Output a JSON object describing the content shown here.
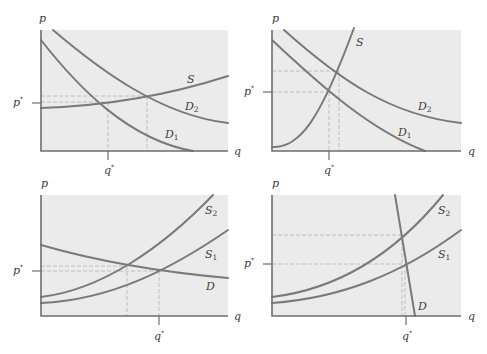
{
  "figure": {
    "panels": [
      {
        "id": "top-left",
        "axis_labels": {
          "y": "p",
          "x": "q"
        },
        "equilibrium_labels": {
          "price": "p",
          "price_sup": "*",
          "quantity": "q",
          "quantity_sup": "*"
        },
        "curves": [
          {
            "name": "S",
            "label": "S",
            "sub": ""
          },
          {
            "name": "D2",
            "label": "D",
            "sub": "2"
          },
          {
            "name": "D1",
            "label": "D",
            "sub": "1"
          }
        ]
      },
      {
        "id": "top-right",
        "axis_labels": {
          "y": "p",
          "x": "q"
        },
        "equilibrium_labels": {
          "price": "p",
          "price_sup": "*",
          "quantity": "q",
          "quantity_sup": "*"
        },
        "curves": [
          {
            "name": "S",
            "label": "S",
            "sub": ""
          },
          {
            "name": "D2",
            "label": "D",
            "sub": "2"
          },
          {
            "name": "D1",
            "label": "D",
            "sub": "1"
          }
        ]
      },
      {
        "id": "bottom-left",
        "axis_labels": {
          "y": "p",
          "x": "q"
        },
        "equilibrium_labels": {
          "price": "p",
          "price_sup": "*",
          "quantity": "q",
          "quantity_sup": "*"
        },
        "curves": [
          {
            "name": "S2",
            "label": "S",
            "sub": "2"
          },
          {
            "name": "S1",
            "label": "S",
            "sub": "1"
          },
          {
            "name": "D",
            "label": "D",
            "sub": ""
          }
        ]
      },
      {
        "id": "bottom-right",
        "axis_labels": {
          "y": "p",
          "x": "q"
        },
        "equilibrium_labels": {
          "price": "p",
          "price_sup": "*",
          "quantity": "q",
          "quantity_sup": "*"
        },
        "curves": [
          {
            "name": "S2",
            "label": "S",
            "sub": "2"
          },
          {
            "name": "S1",
            "label": "S",
            "sub": "1"
          },
          {
            "name": "D",
            "label": "D",
            "sub": ""
          }
        ]
      }
    ],
    "colors": {
      "panel_background": "#ebebeb",
      "curve": "#7a7a7a",
      "axis": "#6e6e6e",
      "guide": "#b9b9b9",
      "text": "#3c3c3c"
    }
  }
}
